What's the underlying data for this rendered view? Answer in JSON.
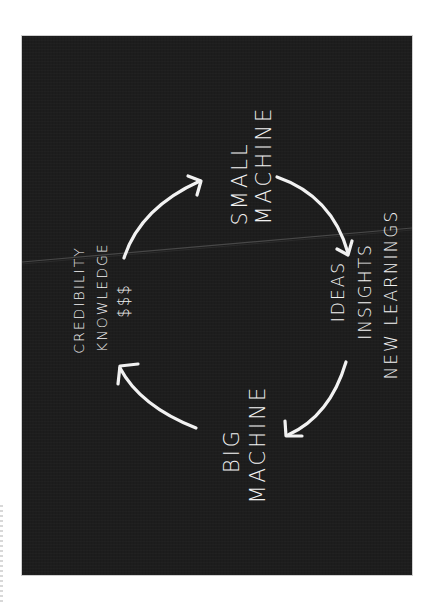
{
  "diagram": {
    "type": "cycle",
    "orientation": "rotated-90-ccw",
    "background_color": "#1d1d1d",
    "stroke_color": "#f2f2f2",
    "nodes": [
      {
        "id": "small_machine",
        "lines": [
          "SMALL",
          "MACHINE"
        ]
      },
      {
        "id": "outputs",
        "lines": [
          "IDEAS",
          "INSIGHTS",
          "NEW LEARNINGS"
        ]
      },
      {
        "id": "big_machine",
        "lines": [
          "BIG",
          "MACHINE"
        ]
      },
      {
        "id": "returns",
        "lines": [
          "CREDIBILITY",
          "KNOWLEDGE",
          "$$$"
        ]
      }
    ],
    "edges": [
      {
        "from": "returns",
        "to": "small_machine"
      },
      {
        "from": "small_machine",
        "to": "outputs"
      },
      {
        "from": "outputs",
        "to": "big_machine"
      },
      {
        "from": "big_machine",
        "to": "returns"
      }
    ]
  }
}
